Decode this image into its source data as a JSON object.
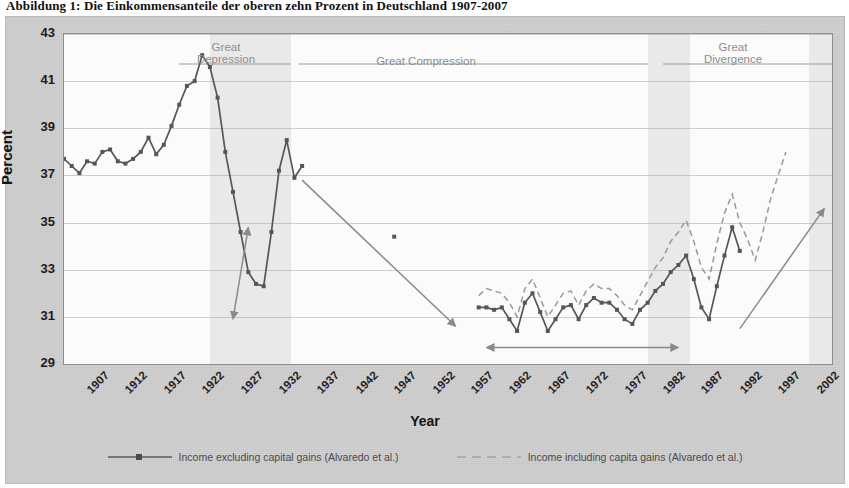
{
  "caption": "Abbildung 1: Die Einkommensanteile der oberen zehn Prozent in Deutschland 1907-2007",
  "axes": {
    "y_title": "Percent",
    "x_title": "Year",
    "y_ticks": [
      "29",
      "31",
      "33",
      "35",
      "37",
      "39",
      "41",
      "43"
    ],
    "x_ticks": [
      "1907",
      "1912",
      "1917",
      "1922",
      "1927",
      "1932",
      "1937",
      "1942",
      "1947",
      "1952",
      "1957",
      "1962",
      "1967",
      "1972",
      "1977",
      "1982",
      "1987",
      "1992",
      "1997",
      "2002",
      "2007"
    ]
  },
  "annotations": {
    "great_depression": "Great\nDepression",
    "great_compression": "Great Compression",
    "great_divergence": "Great\nDivergence"
  },
  "legend": {
    "series_excluding": "Income excluding capital gains (Alvaredo et al.)",
    "series_including": "Income including capita gains (Alvaredo et al.)"
  },
  "colors": {
    "line_solid": "#565656",
    "line_dashed": "#9a9a9a",
    "arrow": "#8a8a8a",
    "panel": "#cfcfcf",
    "plot_bg": "#e9e9e9",
    "band": "#fbfbfb",
    "era_text": "#8d8d8d"
  },
  "chart_data": {
    "type": "line",
    "title": "Abbildung 1: Die Einkommensanteile der oberen zehn Prozent in Deutschland 1907-2007",
    "xlabel": "Year",
    "ylabel": "Percent",
    "xlim": [
      1907,
      2007
    ],
    "ylim": [
      29,
      43
    ],
    "ytick_step": 2,
    "xtick_step": 5,
    "grid": true,
    "legend_position": "bottom",
    "series": [
      {
        "name": "Income excluding capital gains (Alvaredo et al.)",
        "style": "solid",
        "color": "#565656",
        "marker": "square",
        "points": [
          [
            1907,
            37.7
          ],
          [
            1908,
            37.4
          ],
          [
            1909,
            37.1
          ],
          [
            1910,
            37.6
          ],
          [
            1911,
            37.5
          ],
          [
            1912,
            38.0
          ],
          [
            1913,
            38.1
          ],
          [
            1914,
            37.6
          ],
          [
            1915,
            37.5
          ],
          [
            1916,
            37.7
          ],
          [
            1917,
            38.0
          ],
          [
            1918,
            38.6
          ],
          [
            1919,
            37.9
          ],
          [
            1920,
            38.3
          ],
          [
            1921,
            39.1
          ],
          [
            1922,
            40.0
          ],
          [
            1923,
            40.8
          ],
          [
            1924,
            41.0
          ],
          [
            1925,
            42.1
          ],
          [
            1926,
            41.6
          ],
          [
            1927,
            40.3
          ],
          [
            1928,
            38.0
          ],
          [
            1929,
            36.3
          ],
          [
            1930,
            34.6
          ],
          [
            1931,
            32.9
          ],
          [
            1932,
            32.4
          ],
          [
            1933,
            32.3
          ],
          [
            1934,
            34.6
          ],
          [
            1935,
            37.2
          ],
          [
            1936,
            38.5
          ],
          [
            1937,
            36.9
          ],
          [
            1938,
            37.4
          ],
          [
            1950,
            34.4
          ],
          [
            1961,
            31.4
          ],
          [
            1962,
            31.4
          ],
          [
            1963,
            31.3
          ],
          [
            1964,
            31.4
          ],
          [
            1965,
            30.9
          ],
          [
            1966,
            30.4
          ],
          [
            1967,
            31.6
          ],
          [
            1968,
            32.0
          ],
          [
            1969,
            31.2
          ],
          [
            1970,
            30.4
          ],
          [
            1971,
            30.9
          ],
          [
            1972,
            31.4
          ],
          [
            1973,
            31.5
          ],
          [
            1974,
            30.9
          ],
          [
            1975,
            31.5
          ],
          [
            1976,
            31.8
          ],
          [
            1977,
            31.6
          ],
          [
            1978,
            31.6
          ],
          [
            1979,
            31.3
          ],
          [
            1980,
            30.9
          ],
          [
            1981,
            30.7
          ],
          [
            1982,
            31.3
          ],
          [
            1983,
            31.6
          ],
          [
            1984,
            32.1
          ],
          [
            1985,
            32.4
          ],
          [
            1986,
            32.9
          ],
          [
            1987,
            33.2
          ],
          [
            1988,
            33.6
          ],
          [
            1989,
            32.6
          ],
          [
            1990,
            31.4
          ],
          [
            1991,
            30.9
          ],
          [
            1992,
            32.3
          ],
          [
            1993,
            33.6
          ],
          [
            1994,
            34.8
          ],
          [
            1995,
            33.8
          ]
        ]
      },
      {
        "name": "Income including capita gains (Alvaredo et al.)",
        "style": "dashed",
        "color": "#9a9a9a",
        "marker": "none",
        "points": [
          [
            1961,
            31.9
          ],
          [
            1962,
            32.2
          ],
          [
            1963,
            32.1
          ],
          [
            1964,
            32.0
          ],
          [
            1965,
            31.6
          ],
          [
            1966,
            31.0
          ],
          [
            1967,
            32.2
          ],
          [
            1968,
            32.6
          ],
          [
            1969,
            31.8
          ],
          [
            1970,
            31.0
          ],
          [
            1971,
            31.5
          ],
          [
            1972,
            32.0
          ],
          [
            1973,
            32.1
          ],
          [
            1974,
            31.5
          ],
          [
            1975,
            32.1
          ],
          [
            1976,
            32.4
          ],
          [
            1977,
            32.2
          ],
          [
            1978,
            32.2
          ],
          [
            1979,
            31.9
          ],
          [
            1980,
            31.5
          ],
          [
            1981,
            31.3
          ],
          [
            1982,
            31.9
          ],
          [
            1983,
            32.5
          ],
          [
            1984,
            33.1
          ],
          [
            1985,
            33.5
          ],
          [
            1986,
            34.2
          ],
          [
            1987,
            34.6
          ],
          [
            1988,
            35.1
          ],
          [
            1989,
            34.2
          ],
          [
            1990,
            33.1
          ],
          [
            1991,
            32.6
          ],
          [
            1992,
            34.1
          ],
          [
            1993,
            35.4
          ],
          [
            1994,
            36.2
          ],
          [
            1995,
            35.0
          ],
          [
            1996,
            34.3
          ],
          [
            1997,
            33.4
          ],
          [
            1998,
            34.6
          ],
          [
            1999,
            36.0
          ],
          [
            2000,
            37.0
          ],
          [
            2001,
            38.0
          ]
        ]
      }
    ],
    "arrows": [
      {
        "name": "depression-drop",
        "from": [
          1931,
          34.8
        ],
        "to": [
          1929,
          30.9
        ],
        "double": true
      },
      {
        "name": "compression-decline",
        "from": [
          1938,
          36.8
        ],
        "to": [
          1958,
          30.6
        ],
        "double": false
      },
      {
        "name": "compression-span",
        "from": [
          1962,
          29.7
        ],
        "to": [
          1987,
          29.7
        ],
        "double": true
      },
      {
        "name": "divergence-rise",
        "from": [
          1995,
          30.5
        ],
        "to": [
          2006,
          35.6
        ],
        "double": false
      }
    ]
  }
}
